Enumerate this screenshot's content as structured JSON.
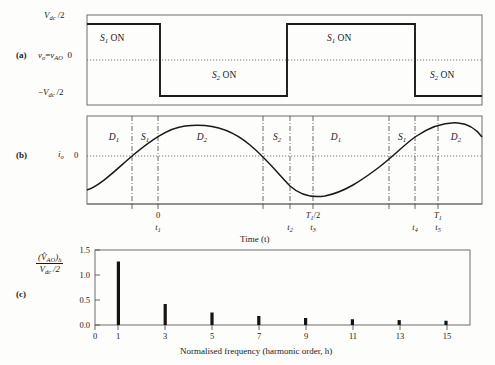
{
  "figure": {
    "panels": [
      {
        "tag": "(a)",
        "x": 16,
        "y": 54
      },
      {
        "tag": "(b)",
        "x": 16,
        "y": 155
      },
      {
        "tag": "(c)",
        "x": 16,
        "y": 294
      }
    ]
  },
  "panel_a": {
    "name": "output-voltage-waveform",
    "y_axis": {
      "label_top": "V<sub class=\"sub\">dc</sub>/2",
      "label_mid_name": "v<sub class=\"sub\">o</sub>=v<sub class=\"sub\">AO</sub>",
      "label_mid_value": "0",
      "label_bottom": "−V<sub class=\"sub\">dc</sub>/2"
    },
    "region_labels": [
      {
        "text": "S₁ ON",
        "x": 124,
        "y": 38
      },
      {
        "text": "S₂ ON",
        "x": 237,
        "y": 73
      },
      {
        "text": "S₁ ON",
        "x": 351,
        "y": 38
      },
      {
        "text": "S₂ ON",
        "x": 452,
        "y": 73
      }
    ]
  },
  "panel_b": {
    "name": "output-current-waveform",
    "y_axis_label": "i<sub class=\"sub\">o</sub>",
    "y_zero_label": "0",
    "x_axis_title": "Time (t)",
    "region_labels": [
      {
        "text": "D₁",
        "x": 110
      },
      {
        "text": "S₁",
        "x": 145
      },
      {
        "text": "D₂",
        "x": 200
      },
      {
        "text": "S₂",
        "x": 276
      },
      {
        "text": "D₁",
        "x": 334
      },
      {
        "text": "S₁",
        "x": 401
      },
      {
        "text": "D₂",
        "x": 452
      }
    ],
    "x_ticks": [
      {
        "top": "0",
        "bottom": "t₁",
        "x": 158
      },
      {
        "top": "",
        "bottom": "t₂",
        "x": 290
      },
      {
        "top": "T₁/2",
        "bottom": "t₃",
        "x": 313
      },
      {
        "top": "",
        "bottom": "t₄",
        "x": 415
      },
      {
        "top": "T₁",
        "bottom": "t₅",
        "x": 438
      }
    ]
  },
  "panel_c": {
    "name": "harmonic-spectrum",
    "y_axis_label_num": "(V̂<sub class=\"sub\">AO</sub>)<sub class=\"sub\">h</sub>",
    "y_axis_label_den": "V<sub class=\"sub\">dc</sub>/2"
  },
  "chart_data": {
    "type": "bar",
    "title": "",
    "xlabel": "Normalised frequency (harmonic order,  h)",
    "ylabel": "(V̂_AO)_h / (V_dc/2)",
    "categories": [
      "0",
      "1",
      "3",
      "5",
      "7",
      "9",
      "11",
      "13",
      "15"
    ],
    "x_tick_values": [
      0,
      1,
      3,
      5,
      7,
      9,
      11,
      13,
      15
    ],
    "y_tick_labels": [
      "0.0",
      "0.5",
      "1.0",
      "1.5"
    ],
    "y_tick_values": [
      0.0,
      0.5,
      1.0,
      1.5
    ],
    "ylim": [
      0,
      1.5
    ],
    "xlim": [
      0,
      16
    ],
    "grid": false,
    "series": [
      {
        "name": "harmonic magnitude",
        "x": [
          1,
          3,
          5,
          7,
          9,
          11,
          13,
          15
        ],
        "values": [
          1.27,
          0.42,
          0.25,
          0.18,
          0.14,
          0.115,
          0.098,
          0.085
        ]
      }
    ],
    "bar_color": "#141414"
  },
  "waveform_a": {
    "type": "square",
    "description": "Two-level square wave between +Vdc/2 and -Vdc/2",
    "transitions_px": [
      87,
      160,
      287,
      415
    ],
    "levels": [
      "+Vdc/2",
      "-Vdc/2",
      "+Vdc/2",
      "-Vdc/2"
    ]
  },
  "waveform_b": {
    "type": "sine",
    "description": "Sinusoidal output current lagging the voltage",
    "zero_crossings_px": [
      132,
      290,
      415
    ]
  }
}
